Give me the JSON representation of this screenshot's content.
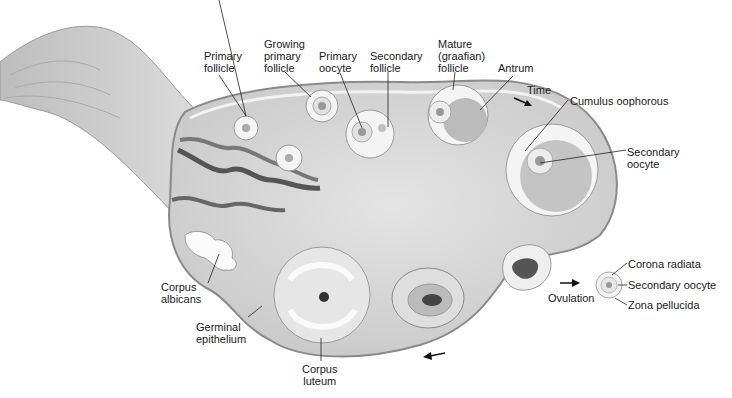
{
  "labels": {
    "primary_follicle": [
      "Primary",
      "follicle"
    ],
    "growing_primary_follicle": [
      "Growing",
      "primary",
      "follicle"
    ],
    "primary_oocyte": [
      "Primary",
      "oocyte"
    ],
    "secondary_follicle": [
      "Secondary",
      "follicle"
    ],
    "mature_follicle": [
      "Mature",
      "(graafian)",
      "follicle"
    ],
    "antrum": "Antrum",
    "time": "Time",
    "cumulus_oophorous": "Cumulus oophorous",
    "secondary_oocyte": [
      "Secondary",
      "oocyte"
    ],
    "corona_radiata": "Corona radiata",
    "released_secondary_oocyte": "Secondary oocyte",
    "zona_pellucida": "Zona pellucida",
    "ovulation": "Ovulation",
    "corpus_albicans": [
      "Corpus",
      "albicans"
    ],
    "germinal_epithelium": [
      "Germinal",
      "epithelium"
    ],
    "corpus_luteum": [
      "Corpus",
      "luteum"
    ]
  },
  "arrows": [
    "time-arrow",
    "ovulation-arrow",
    "cycle-arrow"
  ],
  "colors": {
    "tissue": "#d6d6d6",
    "tissue_dark": "#a8a8a8",
    "antrum": "#b8b8b8",
    "outline": "#8a8a8a",
    "text": "#1a1a1a"
  }
}
